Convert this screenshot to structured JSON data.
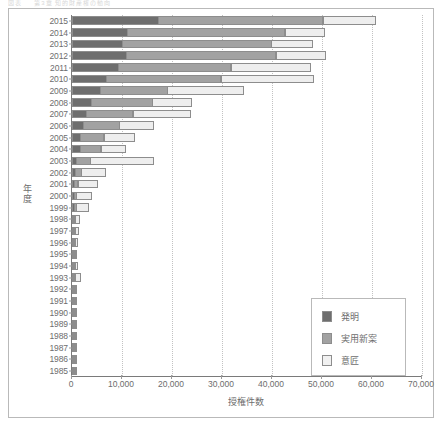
{
  "top_caption": "図表  　  第3章 知的財産権の動向",
  "chart_data": {
    "type": "bar",
    "orientation": "horizontal",
    "stacked": true,
    "title": "",
    "xlabel": "授権件数",
    "ylabel": "年度",
    "xlim": [
      0,
      70000
    ],
    "xticks": [
      0,
      10000,
      20000,
      30000,
      40000,
      50000,
      60000,
      70000
    ],
    "xtick_labels": [
      "0",
      "10,000",
      "20,000",
      "30,000",
      "40,000",
      "50,000",
      "60,000",
      "70,000"
    ],
    "grid": true,
    "legend_position": "bottom-right",
    "categories": [
      "2015",
      "2014",
      "2013",
      "2012",
      "2011",
      "2010",
      "2009",
      "2008",
      "2007",
      "2006",
      "2005",
      "2004",
      "2003",
      "2002",
      "2001",
      "2000",
      "1999",
      "1998",
      "1997",
      "1996",
      "1995",
      "1994",
      "1993",
      "1992",
      "1991",
      "1990",
      "1989",
      "1988",
      "1987",
      "1986",
      "1985"
    ],
    "series": [
      {
        "name": "発明",
        "color": "#6e6e6e",
        "values": [
          17400,
          11200,
          10200,
          11000,
          9300,
          6900,
          5700,
          3900,
          2900,
          2300,
          1800,
          1800,
          900,
          700,
          500,
          500,
          500,
          300,
          300,
          200,
          200,
          200,
          300,
          200,
          150,
          150,
          150,
          150,
          100,
          100,
          100
        ]
      },
      {
        "name": "実用新案",
        "color": "#a2a2a2",
        "values": [
          33000,
          31600,
          29900,
          30000,
          22700,
          23100,
          13600,
          12400,
          9500,
          7400,
          4800,
          4200,
          3000,
          1400,
          900,
          600,
          600,
          300,
          200,
          150,
          150,
          150,
          200,
          150,
          100,
          100,
          150,
          100,
          80,
          60,
          50
        ]
      },
      {
        "name": "意匠",
        "color": "#eeeeee",
        "values": [
          10600,
          8000,
          8400,
          10000,
          16000,
          18600,
          15400,
          8000,
          11600,
          7000,
          6200,
          5000,
          12800,
          4900,
          4100,
          3200,
          2600,
          1100,
          900,
          600,
          400,
          600,
          1300,
          500,
          400,
          350,
          350,
          250,
          150,
          100,
          60
        ]
      }
    ]
  },
  "legend": {
    "items": [
      {
        "label": "発明",
        "color": "#6e6e6e"
      },
      {
        "label": "実用新案",
        "color": "#a2a2a2"
      },
      {
        "label": "意匠",
        "color": "#f1f1f1"
      }
    ]
  }
}
